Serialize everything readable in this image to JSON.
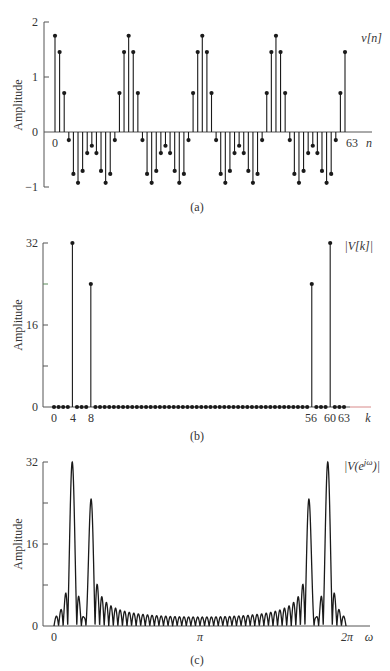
{
  "chart_data": [
    {
      "panel": "a",
      "type": "stem",
      "title": "",
      "series_label": "v[n]",
      "ylabel": "Amplitude",
      "xlabel": "n",
      "caption": "(a)",
      "ylim": [
        -1,
        2
      ],
      "yticks": [
        2,
        1,
        0,
        -1
      ],
      "yticks_labels": [
        "2",
        "1",
        "0",
        "−1"
      ],
      "xtick_labels": [
        {
          "x": 0,
          "label": "0"
        },
        {
          "x": 63,
          "label": "63"
        }
      ],
      "n_range": [
        0,
        63
      ],
      "formula": "v[n] = cos(2π·4n/64) + 0.75·cos(2π·8n/64)",
      "components": [
        {
          "k": 4,
          "amp": 1.0
        },
        {
          "k": 8,
          "amp": 0.75
        }
      ],
      "N": 64,
      "values": [
        1.75,
        1.454,
        0.707,
        -0.147,
        -0.763,
        -0.924,
        -0.707,
        -0.384,
        -0.25,
        -0.384,
        -0.707,
        -0.924,
        -0.763,
        -0.147,
        0.707,
        1.454,
        1.75,
        1.454,
        0.707,
        -0.147,
        -0.763,
        -0.924,
        -0.707,
        -0.384,
        -0.25,
        -0.384,
        -0.707,
        -0.924,
        -0.763,
        -0.147,
        0.707,
        1.454,
        1.75,
        1.454,
        0.707,
        -0.147,
        -0.763,
        -0.924,
        -0.707,
        -0.384,
        -0.25,
        -0.384,
        -0.707,
        -0.924,
        -0.763,
        -0.147,
        0.707,
        1.454,
        1.75,
        1.454,
        0.707,
        -0.147,
        -0.763,
        -0.924,
        -0.707,
        -0.384,
        -0.25,
        -0.384,
        -0.707,
        -0.924,
        -0.763,
        -0.147,
        0.707,
        1.454
      ]
    },
    {
      "panel": "b",
      "type": "stem",
      "series_label": "|V[k]|",
      "ylabel": "Amplitude",
      "xlabel": "k",
      "caption": "(b)",
      "ylim": [
        0,
        32
      ],
      "yticks": [
        32,
        24,
        16,
        8,
        0
      ],
      "yticks_labels": [
        "32",
        "",
        "16",
        "",
        "0"
      ],
      "xtick_labels": [
        {
          "x": 0,
          "label": "0"
        },
        {
          "x": 4,
          "label": "4"
        },
        {
          "x": 8,
          "label": "8"
        },
        {
          "x": 56,
          "label": "56"
        },
        {
          "x": 60,
          "label": "60"
        },
        {
          "x": 63,
          "label": "63"
        }
      ],
      "k_range": [
        0,
        63
      ],
      "nonzero": [
        {
          "k": 4,
          "value": 32
        },
        {
          "k": 8,
          "value": 24
        },
        {
          "k": 56,
          "value": 24
        },
        {
          "k": 60,
          "value": 32
        }
      ]
    },
    {
      "panel": "c",
      "type": "line",
      "series_label": "|V(e^{jω})|",
      "ylabel": "Amplitude",
      "xlabel": "ω",
      "caption": "(c)",
      "ylim": [
        0,
        32
      ],
      "yticks": [
        32,
        24,
        16,
        8,
        0
      ],
      "yticks_labels": [
        "32",
        "",
        "16",
        "",
        "0"
      ],
      "xtick_labels": [
        {
          "x": 0,
          "label": "0"
        },
        {
          "x": 3.14159,
          "label": "π"
        },
        {
          "x": 6.28318,
          "label": "2π"
        }
      ],
      "x_range": [
        0,
        6.28318
      ],
      "peaks": [
        {
          "omega": "2π·4/64",
          "value": 32
        },
        {
          "omega": "2π·8/64",
          "value": 24
        },
        {
          "omega": "2π·56/64",
          "value": 24
        },
        {
          "omega": "2π·60/64",
          "value": 32
        }
      ],
      "description": "DTFT magnitude of 64-point v[n]: sinc-like mainlobes at the DFT peak frequencies with decaying sidelobes"
    }
  ],
  "labels": {
    "a": {
      "ylabel": "Amplitude",
      "series": "v[n]",
      "xname": "n",
      "caption": "(a)",
      "y2": "2",
      "y1": "1",
      "y0": "0",
      "ym1": "−1",
      "x0": "0",
      "x63": "63"
    },
    "b": {
      "ylabel": "Amplitude",
      "series": "|V[k]|",
      "xname": "k",
      "caption": "(b)",
      "y32": "32",
      "y16": "16",
      "y0": "0",
      "x0": "0",
      "x4": "4",
      "x8": "8",
      "x56": "56",
      "x60": "60",
      "x63": "63"
    },
    "c": {
      "ylabel": "Amplitude",
      "series": "|V(e^{jω})|",
      "series_base": "|V(e",
      "series_sup": "jω",
      "series_end": ")|",
      "xname": "ω",
      "caption": "(c)",
      "y32": "32",
      "y16": "16",
      "y0": "0",
      "x0": "0",
      "xpi": "π",
      "x2pi": "2π"
    }
  },
  "colors": {
    "ink": "#1a1a1a",
    "axis": "#555555",
    "axis_tail": "#d88a8a"
  }
}
